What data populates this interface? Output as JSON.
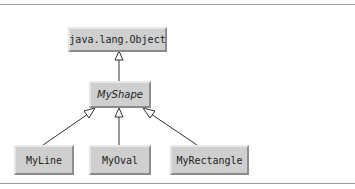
{
  "diagram": {
    "type": "uml-class-hierarchy",
    "root": {
      "label": "java.lang.Object"
    },
    "abstract_class": {
      "label": "MyShape"
    },
    "subclasses": [
      {
        "label": "MyLine"
      },
      {
        "label": "MyOval"
      },
      {
        "label": "MyRectangle"
      }
    ],
    "relations": [
      {
        "from": "MyShape",
        "to": "java.lang.Object",
        "kind": "generalization"
      },
      {
        "from": "MyLine",
        "to": "MyShape",
        "kind": "generalization"
      },
      {
        "from": "MyOval",
        "to": "MyShape",
        "kind": "generalization"
      },
      {
        "from": "MyRectangle",
        "to": "MyShape",
        "kind": "generalization"
      }
    ]
  }
}
